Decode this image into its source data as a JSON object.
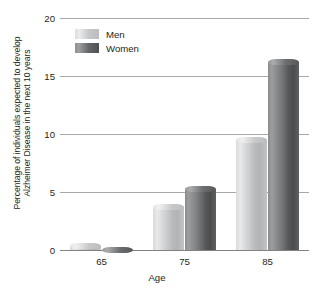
{
  "chart_data": {
    "type": "bar",
    "title": "",
    "subtitle": "",
    "xlabel": "Age",
    "ylabel": "Percentage of individuals expected to develop Alzheimer Disease in the next 10 years",
    "ylabel_lines": [
      "Percentage of individuals expected to develop",
      "Alzheimer Disease in the next 10 years"
    ],
    "categories": [
      "65",
      "75",
      "85"
    ],
    "series": [
      {
        "name": "Men",
        "values": [
          0.6,
          4.0,
          9.7
        ],
        "color": "#c9cacb"
      },
      {
        "name": "Women",
        "values": [
          0.3,
          5.5,
          16.5
        ],
        "color": "#5b5d5f"
      }
    ],
    "ylim": [
      0,
      20
    ],
    "yticks": [
      0,
      5,
      10,
      15,
      20
    ],
    "ytick_labels": [
      "0",
      "5",
      "10",
      "15",
      "20"
    ],
    "grid": true,
    "grid_axis": "y",
    "legend": [
      "Men",
      "Women"
    ],
    "legend_position": "top-left-inside"
  },
  "axes": {
    "y_title_line1": "Percentage of individuals expected to develop",
    "y_title_line2": "Alzheimer Disease in the next 10 years",
    "x_title": "Age",
    "y_ticks": [
      "20",
      "15",
      "10",
      "5",
      "0"
    ],
    "x_ticks": [
      "65",
      "75",
      "85"
    ]
  },
  "legend": {
    "items": [
      {
        "label": "Men",
        "swatch": "men-swatch"
      },
      {
        "label": "Women",
        "swatch": "women-swatch"
      }
    ]
  },
  "colors": {
    "grid": "#a7a9ac",
    "axis": "#808285",
    "text": "#231f20",
    "men": "#c9cacb",
    "women": "#5b5d5f",
    "background": "#ffffff"
  }
}
